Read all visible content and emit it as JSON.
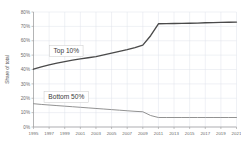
{
  "chart_data": {
    "type": "line",
    "title": "",
    "xlabel": "",
    "ylabel": "Share of total",
    "ylim": [
      0,
      80
    ],
    "ytick_labels": [
      "0%",
      "10%",
      "20%",
      "30%",
      "40%",
      "50%",
      "60%",
      "70%",
      "80%"
    ],
    "ytick_values": [
      0,
      10,
      20,
      30,
      40,
      50,
      60,
      70,
      80
    ],
    "xlim": [
      1995,
      2021
    ],
    "xtick_labels": [
      "1995",
      "1997",
      "1999",
      "2001",
      "2003",
      "2005",
      "2007",
      "2009",
      "2011",
      "2013",
      "2015",
      "2017",
      "2019",
      "2021"
    ],
    "xtick_values": [
      1995,
      1997,
      1999,
      2001,
      2003,
      2005,
      2007,
      2009,
      2011,
      2013,
      2015,
      2017,
      2019,
      2021
    ],
    "grid": true,
    "legend_position": "inline-annotation",
    "x": [
      1995,
      1996,
      1997,
      1998,
      1999,
      2000,
      2001,
      2002,
      2003,
      2004,
      2005,
      2006,
      2007,
      2008,
      2009,
      2010,
      2011,
      2012,
      2013,
      2014,
      2015,
      2016,
      2017,
      2018,
      2019,
      2020,
      2021
    ],
    "series": [
      {
        "name": "Top 10%",
        "color": "#4a4a4a",
        "annotation": "Top 10%",
        "values": [
          40.2,
          41.8,
          43.2,
          44.4,
          45.5,
          46.5,
          47.4,
          48.2,
          49.0,
          50.2,
          51.4,
          52.6,
          53.8,
          55.2,
          57.0,
          63.5,
          71.8,
          71.9,
          72.0,
          72.1,
          72.2,
          72.3,
          72.5,
          72.6,
          72.8,
          72.9,
          73.0
        ]
      },
      {
        "name": "Bottom 50%",
        "color": "#8c8c8c",
        "annotation": "Bottom 50%",
        "values": [
          16.2,
          15.7,
          15.3,
          14.9,
          14.5,
          14.1,
          13.7,
          13.3,
          12.9,
          12.5,
          12.1,
          11.7,
          11.3,
          10.9,
          10.6,
          8.0,
          6.6,
          6.6,
          6.6,
          6.6,
          6.6,
          6.6,
          6.6,
          6.6,
          6.6,
          6.6,
          6.6
        ]
      }
    ],
    "annotations": [
      {
        "text": "Top 10%",
        "x": 1999.2,
        "y": 53.0
      },
      {
        "text": "Bottom 50%",
        "x": 1999.2,
        "y": 21.0
      }
    ]
  }
}
